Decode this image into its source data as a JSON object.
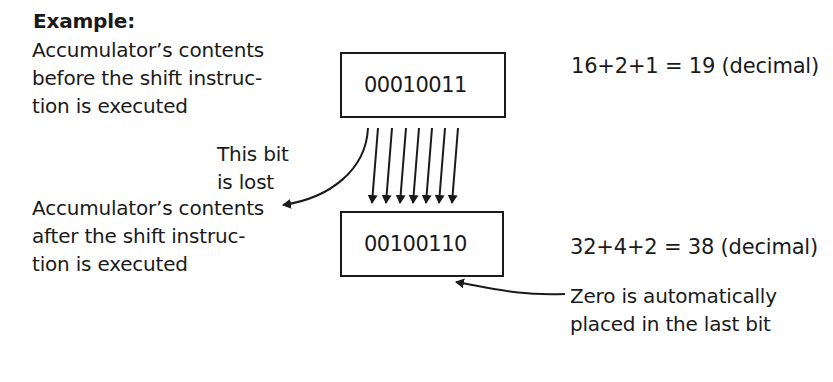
{
  "title": "Example:",
  "before_label": [
    "Accumulator’s contents",
    "before the shift instruc-",
    "tion is executed"
  ],
  "after_label": [
    "Accumulator’s contents",
    "after the shift instruc-",
    "tion is executed"
  ],
  "lost_bit_label": [
    "This bit",
    "is lost"
  ],
  "zero_label": [
    "Zero is automatically",
    "placed in the last bit"
  ],
  "before_value": "00010011",
  "after_value": "00100110",
  "before_decimal": "16+2+1 = 19 (decimal)",
  "after_decimal": "32+4+2 = 38 (decimal)",
  "colors": {
    "ink": "#1a1a1a",
    "background": "#ffffff"
  }
}
